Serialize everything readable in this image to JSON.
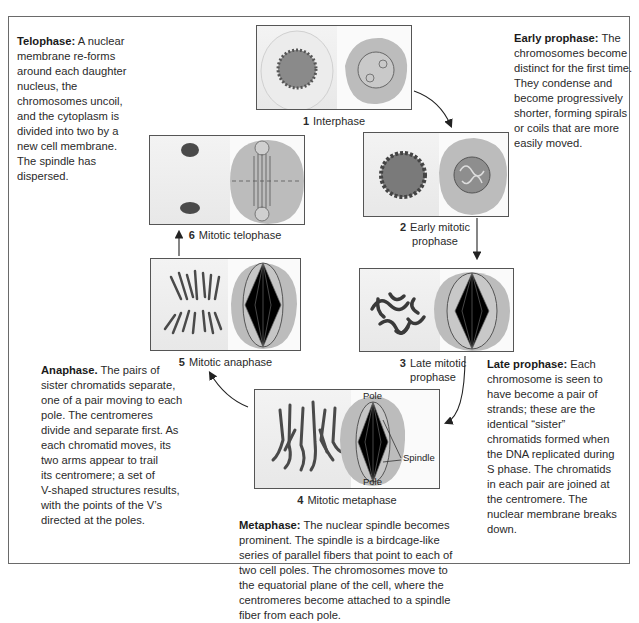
{
  "descriptions": {
    "telophase": {
      "title": "Telophase:",
      "lines": [
        "A nuclear",
        "membrane re-forms",
        "around each daughter",
        "nucleus, the",
        "chromosomes uncoil,",
        "and the cytoplasm is",
        "divided into two by a",
        "new cell membrane.",
        "The spindle has",
        "dispersed."
      ]
    },
    "early_prophase": {
      "title": "Early prophase:",
      "lines": [
        "The",
        "chromosomes become",
        "distinct for the first time.",
        "They condense and",
        "become progressively",
        "shorter, forming spirals",
        "or coils that are more",
        "easily moved."
      ]
    },
    "late_prophase": {
      "title": "Late prophase:",
      "lines": [
        "Each",
        "chromosome is seen to",
        "have become a pair of",
        "strands; these are the",
        "identical “sister”",
        "chromatids formed when",
        "the DNA replicated during",
        "S phase. The chromatids",
        "in each pair are joined at",
        "the centromere. The",
        "nuclear membrane breaks",
        "down."
      ]
    },
    "anaphase": {
      "title": "Anaphase.",
      "lines": [
        "The pairs of",
        "sister chromatids separate,",
        "one of a pair moving to each",
        "pole. The centromeres",
        "divide and separate first. As",
        "each chromatid moves, its",
        "two arms appear to trail",
        "its centromere; a set of",
        "V-shaped structures results,",
        "with the points of the V’s",
        "directed at the poles."
      ]
    },
    "metaphase": {
      "title": "Metaphase:",
      "lines": [
        "The nuclear spindle becomes",
        "prominent. The spindle is a birdcage-like",
        "series of parallel fibers that point to each of",
        "two cell poles. The chromosomes move to",
        "the equatorial plane of the cell, where the",
        "centromeres become attached to a spindle",
        "fiber from each pole."
      ]
    }
  },
  "stages": [
    {
      "num": "1",
      "label_lines": [
        "Interphase"
      ]
    },
    {
      "num": "2",
      "label_lines": [
        "Early mitotic",
        "prophase"
      ]
    },
    {
      "num": "3",
      "label_lines": [
        "Late mitotic",
        "prophase"
      ]
    },
    {
      "num": "4",
      "label_lines": [
        "Mitotic metaphase"
      ]
    },
    {
      "num": "5",
      "label_lines": [
        "Mitotic anaphase"
      ]
    },
    {
      "num": "6",
      "label_lines": [
        "Mitotic telophase"
      ]
    }
  ],
  "annotations": {
    "pole_top": "Pole",
    "pole_bottom": "Pole",
    "spindle": "Spindle"
  },
  "colors": {
    "cell_fill": "#bdbdbd",
    "chromosome": "#3a3a3a",
    "frame": "#6a6a6a"
  }
}
